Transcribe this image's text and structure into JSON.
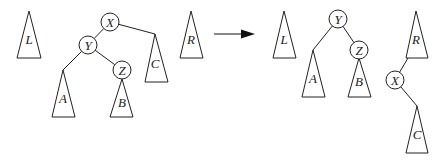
{
  "diagram": {
    "type": "tree-rotation",
    "colors": {
      "stroke": "#222222",
      "background": "#ffffff"
    },
    "before": {
      "subtrees_outside": [
        {
          "id": "L",
          "label": "L",
          "apex": [
            29,
            11
          ],
          "base": [
            17,
            41,
            58
          ]
        },
        {
          "id": "R",
          "label": "R",
          "apex": [
            191,
            11
          ],
          "base": [
            180,
            203,
            58
          ]
        }
      ],
      "nodes": [
        {
          "id": "X",
          "label": "X",
          "cx": 110,
          "cy": 22
        },
        {
          "id": "Y",
          "label": "Y",
          "cx": 88,
          "cy": 45
        },
        {
          "id": "Z",
          "label": "Z",
          "cx": 122,
          "cy": 70
        }
      ],
      "subtrees": [
        {
          "id": "A",
          "label": "A",
          "apex": [
            63,
            70
          ],
          "base": [
            52,
            75,
            117
          ]
        },
        {
          "id": "B",
          "label": "B",
          "apex": [
            122,
            79
          ],
          "base": [
            110,
            133,
            117
          ]
        },
        {
          "id": "C",
          "label": "C",
          "apex": [
            155,
            34
          ],
          "base": [
            145,
            168,
            82
          ]
        }
      ],
      "edges": [
        [
          "X",
          "Y"
        ],
        [
          "X",
          "C"
        ],
        [
          "Y",
          "A"
        ],
        [
          "Y",
          "Z"
        ],
        [
          "Z",
          "B"
        ]
      ]
    },
    "arrow": {
      "from": [
        214,
        34
      ],
      "to": [
        255,
        34
      ],
      "direction": "right"
    },
    "after": {
      "subtrees_outside": [
        {
          "id": "L",
          "label": "L",
          "apex": [
            284,
            11
          ],
          "base": [
            273,
            296,
            58
          ]
        }
      ],
      "nodes": [
        {
          "id": "Y",
          "label": "Y",
          "cx": 338,
          "cy": 19
        },
        {
          "id": "Z",
          "label": "Z",
          "cx": 359,
          "cy": 50
        },
        {
          "id": "X",
          "label": "X",
          "cx": 395,
          "cy": 80
        }
      ],
      "subtrees": [
        {
          "id": "A",
          "label": "A",
          "apex": [
            313,
            50
          ],
          "base": [
            302,
            325,
            97
          ]
        },
        {
          "id": "B",
          "label": "B",
          "apex": [
            359,
            58
          ],
          "base": [
            348,
            371,
            97
          ]
        },
        {
          "id": "R",
          "label": "R",
          "apex": [
            416,
            11
          ],
          "base": [
            406,
            428,
            58
          ]
        },
        {
          "id": "C",
          "label": "C",
          "apex": [
            417,
            106
          ],
          "base": [
            406,
            428,
            153
          ]
        }
      ],
      "edges": [
        [
          "Y",
          "A"
        ],
        [
          "Y",
          "Z"
        ],
        [
          "Z",
          "B"
        ],
        [
          "R",
          "X"
        ],
        [
          "X",
          "C"
        ]
      ]
    }
  }
}
